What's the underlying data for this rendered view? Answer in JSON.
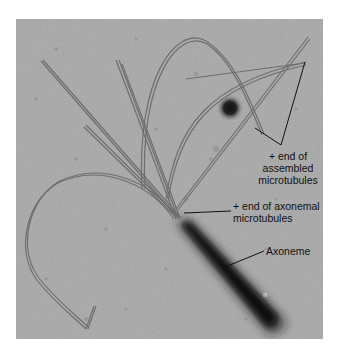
{
  "figure": {
    "type": "electron-micrograph",
    "background_color": "#a9a9a9",
    "labels": [
      {
        "id": "assembled",
        "lines": [
          "+ end of",
          "assembled",
          "microtubules"
        ]
      },
      {
        "id": "axonemal",
        "lines": [
          "+ end of axonemal",
          "microtubules"
        ]
      },
      {
        "id": "axoneme",
        "lines": [
          "Axoneme"
        ]
      }
    ]
  }
}
